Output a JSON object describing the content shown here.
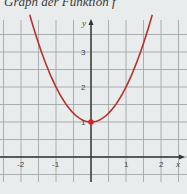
{
  "title": "Graph der Funktion f",
  "colors": {
    "background": "#e9ecec",
    "grid": "#9fa3a3",
    "axis": "#333333",
    "curve": "#c0392b",
    "point": "#e02020"
  },
  "chart_data": {
    "type": "line",
    "title": "Graph der Funktion f",
    "function": "f(x) = x^2 + 1",
    "xlabel": "x",
    "ylabel": "y",
    "x_ticks": [
      "-2",
      "-1",
      "1",
      "2"
    ],
    "y_ticks": [
      "1",
      "2",
      "3"
    ],
    "xlim": [
      -2.5,
      2.5
    ],
    "ylim": [
      -0.5,
      4.2
    ],
    "grid": true,
    "grid_step": 0.5,
    "series": [
      {
        "name": "f",
        "x": [
          -1.7,
          -1.5,
          -1.0,
          -0.5,
          0,
          0.5,
          1.0,
          1.5,
          1.7
        ],
        "y": [
          3.89,
          3.25,
          2.0,
          1.25,
          1.0,
          1.25,
          2.0,
          3.25,
          3.89
        ]
      }
    ],
    "highlighted_points": [
      {
        "x": 0,
        "y": 1,
        "label": "vertex"
      }
    ]
  }
}
